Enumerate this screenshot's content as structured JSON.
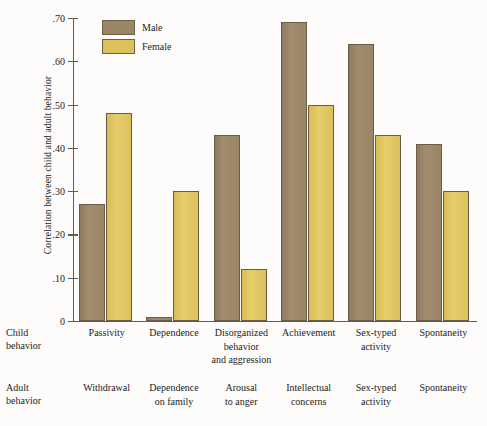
{
  "chart_data": {
    "type": "bar",
    "title": "",
    "ylabel": "Correlation between child and adult behavior",
    "xlabel": "",
    "ylim": [
      0,
      0.7
    ],
    "ytick_labels": [
      ".70",
      ".60",
      ".50",
      ".40",
      ".30",
      ".20",
      ".10",
      "0"
    ],
    "ytick_values": [
      0.7,
      0.6,
      0.5,
      0.4,
      0.3,
      0.2,
      0.1,
      0
    ],
    "grid": false,
    "legend_position": "top-left",
    "categories": [
      "Passivity",
      "Dependence",
      "Disorganized behavior and aggression",
      "Achievement",
      "Sex-typed activity",
      "Spontaneity"
    ],
    "series": [
      {
        "name": "Male",
        "color": "#9b8567",
        "values": [
          0.27,
          0.01,
          0.43,
          0.69,
          0.64,
          0.41
        ]
      },
      {
        "name": "Female",
        "color": "#dcc05a",
        "values": [
          0.48,
          0.3,
          0.12,
          0.5,
          0.43,
          0.3
        ]
      }
    ]
  },
  "legend": {
    "items": [
      {
        "label": "Male",
        "color": "#9b8567"
      },
      {
        "label": "Female",
        "color": "#dcc05a"
      }
    ]
  },
  "axis": {
    "y_title": "Correlation between child and adult behavior",
    "ticks": [
      {
        "label": ".70",
        "value": 0.7
      },
      {
        "label": ".60",
        "value": 0.6
      },
      {
        "label": ".50",
        "value": 0.5
      },
      {
        "label": ".40",
        "value": 0.4
      },
      {
        "label": ".30",
        "value": 0.3
      },
      {
        "label": ".20",
        "value": 0.2
      },
      {
        "label": ".10",
        "value": 0.1
      },
      {
        "label": "0",
        "value": 0
      }
    ]
  },
  "rows": {
    "child": {
      "line1": "Child",
      "line2": "behavior"
    },
    "adult": {
      "line1": "Adult",
      "line2": "behavior"
    }
  },
  "child_behavior": [
    {
      "lines": [
        "Passivity"
      ]
    },
    {
      "lines": [
        "Dependence"
      ]
    },
    {
      "lines": [
        "Disorganized",
        "behavior",
        "and aggression"
      ]
    },
    {
      "lines": [
        "Achievement"
      ]
    },
    {
      "lines": [
        "Sex-typed",
        "activity"
      ]
    },
    {
      "lines": [
        "Spontaneity"
      ]
    }
  ],
  "adult_behavior": [
    {
      "lines": [
        "Withdrawal"
      ]
    },
    {
      "lines": [
        "Dependence",
        "on family"
      ]
    },
    {
      "lines": [
        "Arousal",
        "to anger"
      ]
    },
    {
      "lines": [
        "Intellectual",
        "concerns"
      ]
    },
    {
      "lines": [
        "Sex-typed",
        "activity"
      ]
    },
    {
      "lines": [
        "Spontaneity"
      ]
    }
  ]
}
